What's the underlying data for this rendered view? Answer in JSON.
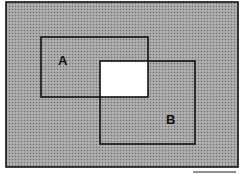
{
  "diagram": {
    "type": "venn-rectangles",
    "colors": {
      "shade": "#9a9a9a",
      "shade_dark": "#7a7a7a",
      "intersection": "#ffffff",
      "stroke": "#111111",
      "background": "#ffffff"
    },
    "universe": {
      "x": 6,
      "y": 2,
      "width": 232,
      "height": 165
    },
    "sets": [
      {
        "id": "A",
        "label": "A",
        "x": 41,
        "y": 37,
        "width": 107,
        "height": 60,
        "label_x": 58,
        "label_y": 65
      },
      {
        "id": "B",
        "label": "B",
        "x": 100,
        "y": 61,
        "width": 95,
        "height": 83,
        "label_x": 166,
        "label_y": 124
      }
    ],
    "intersection": {
      "x": 100,
      "y": 61,
      "width": 48,
      "height": 36
    },
    "footer_line": {
      "x1": 193,
      "x2": 236,
      "y": 172
    }
  }
}
